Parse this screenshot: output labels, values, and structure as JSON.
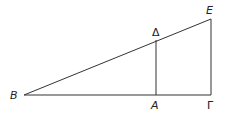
{
  "diagram": {
    "type": "geometry",
    "stroke_color": "#333333",
    "points": {
      "B": {
        "label": "B",
        "x": 24,
        "y": 95
      },
      "A": {
        "label": "A",
        "x": 156,
        "y": 95
      },
      "Gamma": {
        "label": "Γ",
        "x": 211,
        "y": 95
      },
      "Delta": {
        "label": "Δ",
        "x": 156,
        "y": 40
      },
      "E": {
        "label": "E",
        "x": 211,
        "y": 19
      }
    },
    "segments": [
      [
        "B",
        "Gamma"
      ],
      [
        "B",
        "E"
      ],
      [
        "A",
        "Delta"
      ],
      [
        "Gamma",
        "E"
      ]
    ]
  }
}
